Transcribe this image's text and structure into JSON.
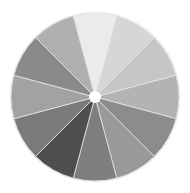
{
  "wheel": {
    "center": [
      95,
      97
    ],
    "radius": 84,
    "hole_radius": 6,
    "start_angle_deg": -15,
    "outline_color": "#f0f0f0",
    "separator_color": "#e6e6e6",
    "hole_color": "#ffffff",
    "slices": [
      {
        "position": "12 o'clock",
        "color": "#ebebeb"
      },
      {
        "position": "1 o'clock",
        "color": "#d6d6d6"
      },
      {
        "position": "2 o'clock",
        "color": "#c6c6c6"
      },
      {
        "position": "3 o'clock",
        "color": "#b3b3b3"
      },
      {
        "position": "4 o'clock",
        "color": "#8c8c8c"
      },
      {
        "position": "5 o'clock",
        "color": "#999999"
      },
      {
        "position": "6 o'clock",
        "color": "#7e7e7e"
      },
      {
        "position": "7 o'clock",
        "color": "#4e4e4e"
      },
      {
        "position": "8 o'clock",
        "color": "#7a7a7a"
      },
      {
        "position": "9 o'clock",
        "color": "#a2a2a2"
      },
      {
        "position": "10 o'clock",
        "color": "#8a8a8a"
      },
      {
        "position": "11 o'clock",
        "color": "#b0b0b0"
      }
    ]
  }
}
